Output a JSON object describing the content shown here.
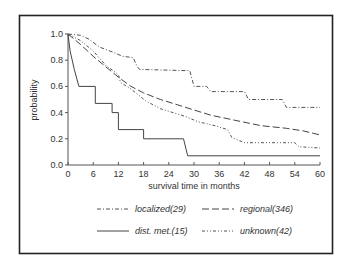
{
  "chart_data": {
    "type": "line",
    "subtype": "kaplan-meier step",
    "title": "",
    "xlabel": "survival time in months",
    "ylabel": "probability",
    "xlim": [
      0,
      60
    ],
    "ylim": [
      0.0,
      1.0
    ],
    "xticks": [
      0,
      6,
      12,
      18,
      24,
      30,
      36,
      42,
      48,
      54,
      60
    ],
    "xtick_labels": [
      "0",
      "6",
      "12",
      "18",
      "24",
      "30",
      "36",
      "42",
      "48",
      "54",
      "60"
    ],
    "yticks": [
      0.0,
      0.2,
      0.4,
      0.6,
      0.8,
      1.0
    ],
    "ytick_labels": [
      "0.0",
      "0.2",
      "0.4",
      "0.6",
      "0.8",
      "1.0"
    ],
    "grid": false,
    "legend_position": "bottom",
    "series": [
      {
        "name": "localized(29)",
        "line_style": "dash-dot",
        "color": "#555555",
        "points": [
          [
            0,
            1.0
          ],
          [
            3,
            0.99
          ],
          [
            5,
            0.96
          ],
          [
            7.5,
            0.9
          ],
          [
            10,
            0.87
          ],
          [
            13,
            0.83
          ],
          [
            15.5,
            0.82
          ],
          [
            16.5,
            0.75
          ],
          [
            17,
            0.73
          ],
          [
            29,
            0.72
          ],
          [
            30,
            0.6
          ],
          [
            33,
            0.6
          ],
          [
            34,
            0.56
          ],
          [
            42,
            0.56
          ],
          [
            43,
            0.5
          ],
          [
            51,
            0.5
          ],
          [
            52,
            0.44
          ],
          [
            60,
            0.44
          ]
        ]
      },
      {
        "name": "regional(346)",
        "line_style": "long-dash",
        "color": "#444444",
        "points": [
          [
            0,
            1.0
          ],
          [
            3,
            0.92
          ],
          [
            6,
            0.83
          ],
          [
            9,
            0.75
          ],
          [
            12,
            0.67
          ],
          [
            15,
            0.6
          ],
          [
            18,
            0.55
          ],
          [
            22,
            0.5
          ],
          [
            26,
            0.46
          ],
          [
            30,
            0.42
          ],
          [
            34,
            0.38
          ],
          [
            40,
            0.34
          ],
          [
            46,
            0.3
          ],
          [
            52,
            0.28
          ],
          [
            56,
            0.26
          ],
          [
            60,
            0.23
          ]
        ]
      },
      {
        "name": "dist. met.(15)",
        "line_style": "solid",
        "color": "#444444",
        "points": [
          [
            0,
            1.0
          ],
          [
            0.5,
            0.87
          ],
          [
            1.5,
            0.73
          ],
          [
            2.6,
            0.6
          ],
          [
            6.5,
            0.6
          ],
          [
            6.5,
            0.47
          ],
          [
            10.5,
            0.47
          ],
          [
            10.5,
            0.4
          ],
          [
            12,
            0.4
          ],
          [
            12,
            0.27
          ],
          [
            18,
            0.27
          ],
          [
            18,
            0.2
          ],
          [
            27.5,
            0.2
          ],
          [
            28.5,
            0.07
          ],
          [
            60,
            0.07
          ]
        ]
      },
      {
        "name": "unknown(42)",
        "line_style": "dash-dot-dot",
        "color": "#555555",
        "points": [
          [
            0,
            1.0
          ],
          [
            3,
            0.95
          ],
          [
            6,
            0.87
          ],
          [
            9,
            0.76
          ],
          [
            12,
            0.69
          ],
          [
            12.5,
            0.63
          ],
          [
            15,
            0.58
          ],
          [
            18.5,
            0.49
          ],
          [
            22,
            0.43
          ],
          [
            26,
            0.39
          ],
          [
            28,
            0.37
          ],
          [
            31,
            0.33
          ],
          [
            35,
            0.3
          ],
          [
            38,
            0.27
          ],
          [
            39,
            0.21
          ],
          [
            42,
            0.17
          ],
          [
            54,
            0.17
          ],
          [
            55,
            0.14
          ],
          [
            60,
            0.13
          ]
        ]
      }
    ]
  }
}
